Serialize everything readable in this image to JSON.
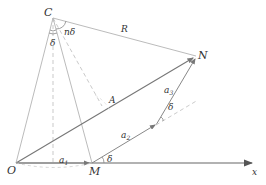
{
  "diagram": {
    "labels": {
      "C": "C",
      "N": "N",
      "O": "O",
      "M": "M",
      "x": "x",
      "R": "R",
      "A": "A",
      "n_delta": "nδ",
      "delta_top": "δ",
      "delta_bottom": "δ",
      "delta_right": "δ",
      "a1": "a",
      "a1_sub": "1",
      "a2": "a",
      "a2_sub": "2",
      "a3": "a",
      "a3_sub": "3"
    },
    "colors": {
      "line": "#999999",
      "dashed": "#bbbbbb",
      "arrow": "#777777",
      "text": "#333333"
    }
  }
}
